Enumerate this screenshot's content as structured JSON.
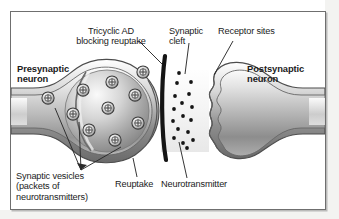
{
  "figure": {
    "title_alt": "Synaptic transmission and tricyclic antidepressant reuptake blockade",
    "background_color": "#ffffff",
    "frame_color": "#6f6f6f",
    "text_color": "#1b1b1b",
    "neuron_fill_light": "#f2f2f2",
    "neuron_fill_mid": "#b9b9b9",
    "neuron_fill_dark": "#7e7e7e",
    "blocker_color": "#1a1a1a",
    "neurotransmitter_dot_color": "#151515"
  },
  "labels": {
    "tricyclic": "Tricyclic AD\nblocking reuptake",
    "synaptic_cleft": "Synaptic\ncleft",
    "receptor_sites": "Receptor sites",
    "presynaptic": "Presynaptic\nneuron",
    "postsynaptic": "Postsynaptic\nneuron",
    "synaptic_vesicles": "Synaptic vesicles\n(packets of\nneurotransmitters)",
    "reuptake": "Reuptake",
    "neurotransmitter": "Neurotransmitter"
  },
  "diagram_elements": {
    "vesicle_count": 10,
    "vesicle_glyph": "circle-with-cross",
    "neurotransmitter_dot_count": 17,
    "leader_line_count": 8,
    "blocker_shape": "vertical-curved-bar",
    "cleft_position_x": 168
  }
}
